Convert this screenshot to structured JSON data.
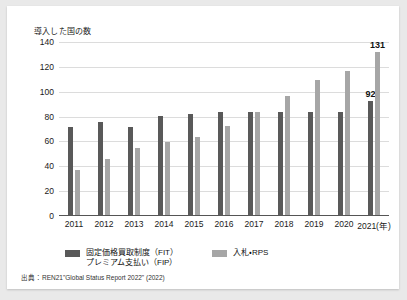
{
  "chart_data": {
    "type": "bar",
    "title": "",
    "ylabel": "導入した国の数",
    "xlabel": "",
    "unit_suffix": "(年)",
    "ylim": [
      0,
      140
    ],
    "yticks": [
      0,
      20,
      40,
      60,
      80,
      100,
      120,
      140
    ],
    "grid": true,
    "legend_position": "bottom",
    "categories": [
      "2011",
      "2012",
      "2013",
      "2014",
      "2015",
      "2016",
      "2017",
      "2018",
      "2019",
      "2020",
      "2021"
    ],
    "x_tick_labels": [
      "2011",
      "2012",
      "2013",
      "2014",
      "2015",
      "2016",
      "2017",
      "2018",
      "2019",
      "2020",
      "2021(年)"
    ],
    "series": [
      {
        "name": "固定価格買取制度（FIT）\nプレミアム支払い（FIP）",
        "legend_line1": "固定価格買取制度（FIT）",
        "legend_line2": "プレミアム支払い（FIP）",
        "color": "#595959",
        "values": [
          71,
          75,
          71,
          80,
          81,
          83,
          83,
          83,
          83,
          83,
          92
        ],
        "labeled_points": {
          "2021": "92"
        }
      },
      {
        "name": "入札・RPS",
        "legend_line1": "入札・RPS",
        "legend_line2": "",
        "color": "#a6a6a6",
        "values": [
          36,
          45,
          54,
          59,
          63,
          72,
          83,
          96,
          109,
          116,
          131
        ],
        "labeled_points": {
          "2021": "131"
        }
      }
    ],
    "annotations": [
      {
        "text": "92",
        "series": "固定価格買取制度（FIT）",
        "category": "2021"
      },
      {
        "text": "131",
        "series": "入札・RPS",
        "category": "2021"
      }
    ]
  },
  "source": {
    "text": "出典：REN21\"Global Status Report 2022\" (2022)"
  },
  "colors": {
    "series_fit": "#595959",
    "series_rps": "#a6a6a6",
    "gridline": "#dcdcdc",
    "axis": "#555555",
    "card_background": "#ffffff",
    "page_background": "#e9e9e9"
  }
}
